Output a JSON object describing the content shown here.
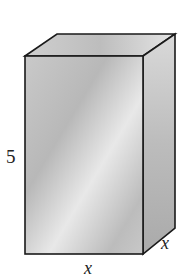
{
  "figure": {
    "type": "rectangular prism",
    "labels": {
      "height": "5",
      "depth": "x",
      "width": "x"
    },
    "colors": {
      "edge": "#1a1a1a",
      "face_light": "#e6e6e6",
      "face_mid": "#bdbdbd",
      "face_dark": "#9a9a9a"
    }
  }
}
